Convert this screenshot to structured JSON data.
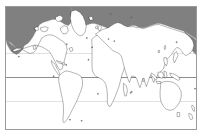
{
  "figure": {
    "type": "map",
    "projection": "equirectangular",
    "frame_color": "#9a9a9a",
    "ocean_color": "#ffffff",
    "land_fill_color": "#ffffff",
    "coastline_color": "#1a1a1a",
    "range_shading_color": "#808080",
    "background_color": "#ffffff"
  },
  "legend": {
    "visible": false,
    "entries": [
      {
        "label": "Shaded range (northern / boreal)",
        "color": "#808080"
      },
      {
        "label": "Unshaded land",
        "color": "#ffffff"
      }
    ]
  },
  "graticule": {
    "visible_lines": [
      {
        "name": "tropic-of-cancer",
        "latitude": 23.5,
        "style": "minor",
        "color": "#e2e2e2"
      },
      {
        "name": "equator",
        "latitude": 0,
        "style": "major",
        "color": "#8d8d8d"
      },
      {
        "name": "tropic-of-capricorn",
        "latitude": -23.5,
        "style": "minor",
        "color": "#e2e2e2"
      }
    ],
    "meridians_visible": false,
    "axis_labels": []
  },
  "map_regions": {
    "shaded": [
      "Arctic North America",
      "Northern Canada",
      "Alaska",
      "Greenland surrounds",
      "Northern Europe",
      "Scandinavia",
      "Northern Russia / Siberia",
      "Kamchatka / Northeast Asia"
    ],
    "unshaded": [
      "Greenland interior",
      "Contiguous United States",
      "Mexico",
      "Central America",
      "South America",
      "Africa",
      "Southern Europe",
      "Middle East",
      "India",
      "Southeast Asia",
      "China",
      "Japan",
      "Indonesia",
      "Australia",
      "New Zealand"
    ]
  },
  "annotations": [],
  "axes": {
    "xlabel": "",
    "ylabel": "",
    "ticks": []
  }
}
